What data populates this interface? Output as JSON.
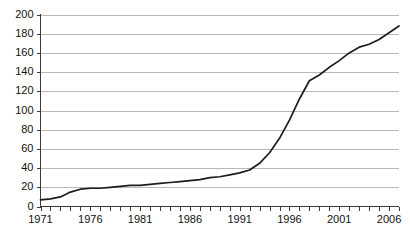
{
  "chart_data": {
    "type": "line",
    "title": "",
    "subtitle": "",
    "xlabel": "",
    "ylabel": "",
    "xlim": [
      1971,
      2007
    ],
    "ylim": [
      0,
      200
    ],
    "grid": true,
    "legend": false,
    "legend_position": "none",
    "line_color": "#1c1c1c",
    "grid_color": "#b8b8b8",
    "axis_color": "#3a3a3a",
    "y_ticks": [
      0,
      20,
      40,
      60,
      80,
      100,
      120,
      140,
      160,
      180,
      200
    ],
    "y_tick_labels": [
      "0",
      "20",
      "40",
      "60",
      "80",
      "100",
      "120",
      "140",
      "160",
      "180",
      "200"
    ],
    "x_ticks": [
      1971,
      1972,
      1973,
      1974,
      1975,
      1976,
      1977,
      1978,
      1979,
      1980,
      1981,
      1982,
      1983,
      1984,
      1985,
      1986,
      1987,
      1988,
      1989,
      1990,
      1991,
      1992,
      1993,
      1994,
      1995,
      1996,
      1997,
      1998,
      1999,
      2000,
      2001,
      2002,
      2003,
      2004,
      2005,
      2006,
      2007
    ],
    "x_tick_labels": [
      "1971",
      "1976",
      "1981",
      "1986",
      "1991",
      "1996",
      "2001",
      "2006"
    ],
    "x_labeled_ticks": [
      1971,
      1976,
      1981,
      1986,
      1991,
      1996,
      2001,
      2006
    ],
    "x": [
      1971,
      1972,
      1973,
      1974,
      1975,
      1976,
      1977,
      1978,
      1979,
      1980,
      1981,
      1982,
      1983,
      1984,
      1985,
      1986,
      1987,
      1988,
      1989,
      1990,
      1991,
      1992,
      1993,
      1994,
      1995,
      1996,
      1997,
      1998,
      1999,
      2000,
      2001,
      2002,
      2003,
      2004,
      2005,
      2006,
      2007
    ],
    "values": [
      7,
      8,
      10,
      15,
      18,
      19,
      19,
      20,
      21,
      22,
      22,
      23,
      24,
      25,
      26,
      27,
      28,
      30,
      31,
      33,
      35,
      38,
      45,
      56,
      71,
      90,
      112,
      131,
      137,
      145,
      152,
      160,
      166,
      169,
      174,
      181,
      188
    ],
    "series": [
      {
        "name": "series-1",
        "values": [
          7,
          8,
          10,
          15,
          18,
          19,
          19,
          20,
          21,
          22,
          22,
          23,
          24,
          25,
          26,
          27,
          28,
          30,
          31,
          33,
          35,
          38,
          45,
          56,
          71,
          90,
          112,
          131,
          137,
          145,
          152,
          160,
          166,
          169,
          174,
          181,
          188
        ]
      }
    ]
  }
}
